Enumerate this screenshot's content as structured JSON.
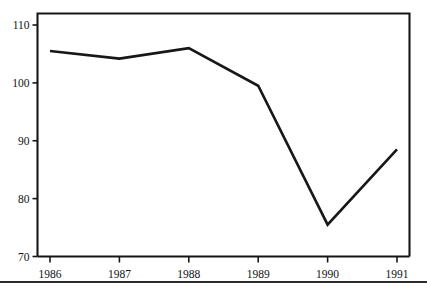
{
  "chart_data": {
    "type": "line",
    "title": "",
    "subtitle": "",
    "xlabel": "",
    "ylabel": "",
    "categories": [
      "1986",
      "1987",
      "1988",
      "1989",
      "1990",
      "1991"
    ],
    "x": [
      1986,
      1987,
      1988,
      1989,
      1990,
      1991
    ],
    "values": [
      105.5,
      104.2,
      106.0,
      99.5,
      75.5,
      88.5
    ],
    "series": [
      {
        "name": "",
        "values": [
          105.5,
          104.2,
          106.0,
          99.5,
          75.5,
          88.5
        ]
      }
    ],
    "xtick_labels": [
      "1986",
      "1987",
      "1988",
      "1989",
      "1990",
      "1991"
    ],
    "ytick_labels": [
      "70",
      "80",
      "90",
      "100",
      "110"
    ],
    "yticks": [
      70,
      80,
      90,
      100,
      110
    ],
    "ylim": [
      70,
      112
    ],
    "xlim": [
      1985.8,
      1991.2
    ],
    "grid": false,
    "legend": false,
    "legend_position": "none",
    "line_color": "#171717",
    "background_color": "#ffffff",
    "annotations": []
  },
  "axes": {
    "y_ticks": [
      {
        "label": "110",
        "value": 110
      },
      {
        "label": "100",
        "value": 100
      },
      {
        "label": "90",
        "value": 90
      },
      {
        "label": "80",
        "value": 80
      },
      {
        "label": "70",
        "value": 70
      }
    ],
    "x_ticks": [
      {
        "label": "1986",
        "value": 1986
      },
      {
        "label": "1987",
        "value": 1987
      },
      {
        "label": "1988",
        "value": 1988
      },
      {
        "label": "1989",
        "value": 1989
      },
      {
        "label": "1990",
        "value": 1990
      },
      {
        "label": "1991",
        "value": 1991
      }
    ]
  }
}
